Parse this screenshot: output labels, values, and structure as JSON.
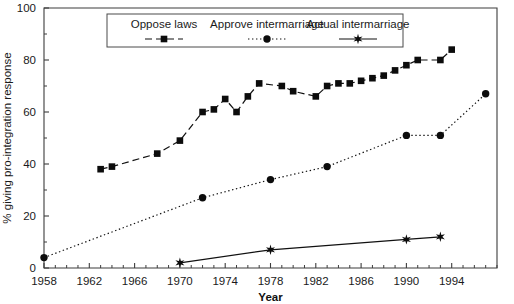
{
  "chart_data": {
    "type": "line",
    "title": "",
    "xlabel": "Year",
    "ylabel": "% giving pro-integration response",
    "xlim": [
      1958,
      1998
    ],
    "ylim": [
      0,
      100
    ],
    "xticks": [
      1958,
      1962,
      1966,
      1970,
      1974,
      1978,
      1982,
      1986,
      1990,
      1994
    ],
    "xticklabels": [
      "1958",
      "1962",
      "1966",
      "1970",
      "1974",
      "1978",
      "1982",
      "1986",
      "1990",
      "1994"
    ],
    "yticks": [
      0,
      20,
      40,
      60,
      80,
      100
    ],
    "yticklabels": [
      "0",
      "20",
      "40",
      "60",
      "80",
      "100"
    ],
    "xminor_step": 1,
    "yminor_step": 10,
    "grid": false,
    "legend_position": "top-center",
    "series": [
      {
        "name": "Oppose laws",
        "marker": "square",
        "linestyle": "dashed",
        "x": [
          1963,
          1964,
          1968,
          1970,
          1972,
          1973,
          1974,
          1975,
          1976,
          1977,
          1979,
          1980,
          1982,
          1983,
          1984,
          1985,
          1986,
          1987,
          1988,
          1989,
          1990,
          1991,
          1993,
          1994
        ],
        "values": [
          38,
          39,
          44,
          49,
          60,
          61,
          65,
          60,
          66,
          71,
          70,
          68,
          66,
          70,
          71,
          71,
          72,
          73,
          74,
          76,
          78,
          80,
          80,
          84
        ]
      },
      {
        "name": "Approve intermarriage",
        "marker": "circle",
        "linestyle": "dotted",
        "x": [
          1958,
          1972,
          1978,
          1983,
          1990,
          1993,
          1997
        ],
        "values": [
          4,
          27,
          34,
          39,
          51,
          51,
          67
        ]
      },
      {
        "name": "Actual intermarriage",
        "marker": "star",
        "linestyle": "solid",
        "x": [
          1970,
          1978,
          1990,
          1993
        ],
        "values": [
          2,
          7,
          11,
          12
        ]
      }
    ]
  },
  "legend": {
    "entries": [
      {
        "label": "Oppose laws"
      },
      {
        "label": "Approve intermarriage"
      },
      {
        "label": "Actual intermarriage"
      }
    ]
  }
}
